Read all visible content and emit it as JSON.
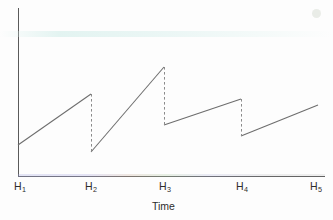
{
  "chart_data": {
    "type": "line",
    "title": "",
    "subtitle": "",
    "xlabel": "Time",
    "ylabel": "",
    "grid": false,
    "legend": "none",
    "xlim": [
      0,
      4
    ],
    "ylim": [
      0,
      1
    ],
    "xtick_labels": [
      "H1",
      "H2",
      "H3",
      "H4",
      "H5"
    ],
    "xtick_html": [
      "H<sub>1</sub>",
      "H<sub>2</sub>",
      "H<sub>3</sub>",
      "H<sub>4</sub>",
      "H<sub>5</sub>"
    ],
    "ytick_labels": [],
    "series": [
      {
        "name": "sawtooth",
        "style": "solid",
        "color": "#6d6d6d",
        "ramps": [
          {
            "index": 1,
            "x_start": 0.0,
            "y_start": 0.18,
            "x_end": 1.0,
            "y_end": 0.49
          },
          {
            "index": 2,
            "x_start": 1.0,
            "y_start": 0.14,
            "x_end": 2.0,
            "y_end": 0.65
          },
          {
            "index": 3,
            "x_start": 2.0,
            "y_start": 0.3,
            "x_end": 3.0,
            "y_end": 0.46
          },
          {
            "index": 4,
            "x_start": 3.0,
            "y_start": 0.24,
            "x_end": 4.0,
            "y_end": 0.42
          }
        ],
        "drops": [
          {
            "index": 1,
            "x": 1.0,
            "y_top": 0.49,
            "y_bottom": 0.14
          },
          {
            "index": 2,
            "x": 2.0,
            "y_top": 0.65,
            "y_bottom": 0.3
          },
          {
            "index": 3,
            "x": 3.0,
            "y_top": 0.46,
            "y_bottom": 0.24
          }
        ]
      }
    ],
    "pixel_geometry": {
      "axis_x": 18,
      "axis_y": 176,
      "axis_top": 8,
      "axis_right": 325,
      "polyline_points": "18,145 91,94",
      "ramp_pixels": [
        {
          "x1": 18,
          "y1": 145,
          "x2": 91,
          "y2": 94
        },
        {
          "x1": 91,
          "y1": 152,
          "x2": 164,
          "y2": 67
        },
        {
          "x1": 164,
          "y1": 125,
          "x2": 241,
          "y2": 99
        },
        {
          "x1": 241,
          "y1": 136,
          "x2": 318,
          "y2": 105
        }
      ],
      "drop_pixels": [
        {
          "x": 91,
          "y1": 94,
          "y2": 152
        },
        {
          "x": 164,
          "y1": 67,
          "y2": 125
        },
        {
          "x": 241,
          "y1": 99,
          "y2": 136
        }
      ],
      "tick_x": [
        22,
        88,
        163,
        239,
        314
      ],
      "tick_y": 181,
      "xlabel_pos": {
        "x": 152,
        "y": 201
      }
    },
    "colors": {
      "line": "#6d6d6d",
      "axis": "#5a5a5a",
      "drop": "#8b8b8b",
      "text": "#2c2c2c",
      "background": "#fdfdfd"
    }
  }
}
